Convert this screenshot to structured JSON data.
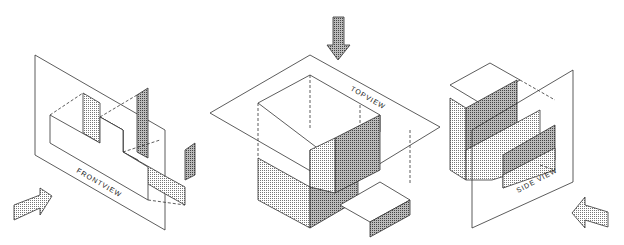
{
  "diagram": {
    "views": [
      {
        "id": "front",
        "label": "FRONTVIEW"
      },
      {
        "id": "top",
        "label": "TOPVIEW"
      },
      {
        "id": "side",
        "label": "SIDE VIEW"
      }
    ],
    "colors": {
      "line": "#333333",
      "shade": "#9a9a9a",
      "background": "#ffffff"
    }
  }
}
